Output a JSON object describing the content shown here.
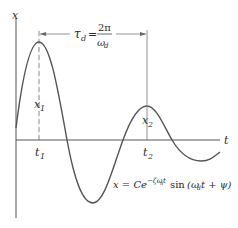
{
  "diagram": {
    "axes": {
      "y_label": "x",
      "x_label": "t"
    },
    "period_annotation": {
      "symbol": "τ",
      "subscript": "d",
      "equals": "=",
      "numerator": "2π",
      "denominator_symbol": "ω",
      "denominator_subscript": "d"
    },
    "markers": [
      {
        "peak_label": "x",
        "peak_sub": "1",
        "time_label": "t",
        "time_sub": "1"
      },
      {
        "peak_label": "x",
        "peak_sub": "2",
        "time_label": "t",
        "time_sub": "2"
      }
    ],
    "equation": {
      "lhs": "x = C",
      "e": "e",
      "exponent": "−ζω",
      "exponent_sub": "n",
      "exponent_t": "t",
      "func": "sin",
      "arg_open": "(ω",
      "arg_sub": "d",
      "arg_rest": "t + ψ)"
    },
    "colors": {
      "curve": "#555555",
      "axes": "#444444",
      "text": "#2a2a2a"
    }
  }
}
